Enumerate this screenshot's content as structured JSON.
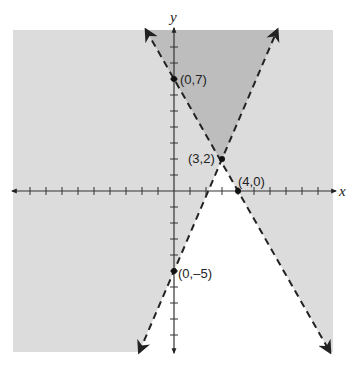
{
  "chart_data": {
    "type": "line",
    "title": "",
    "xlabel": "x",
    "ylabel": "y",
    "xlim": [
      -10,
      10
    ],
    "ylim": [
      -10,
      10
    ],
    "grid": false,
    "ticks": {
      "x": [
        -9,
        -8,
        -7,
        -6,
        -5,
        -4,
        -3,
        -2,
        -1,
        1,
        2,
        3,
        4,
        5,
        6,
        7,
        8,
        9
      ],
      "y": [
        -9,
        -8,
        -7,
        -6,
        -5,
        -4,
        -3,
        -2,
        -1,
        1,
        2,
        3,
        4,
        5,
        6,
        7,
        8,
        9
      ]
    },
    "series": [
      {
        "name": "boundary line 1",
        "style": "dashed",
        "equation": "y = -7/4 x + 7",
        "points": [
          [
            0,
            7
          ],
          [
            4,
            0
          ]
        ]
      },
      {
        "name": "boundary line 2",
        "style": "dashed",
        "equation": "y = 7/3 x - 5",
        "points": [
          [
            0,
            -5
          ],
          [
            3,
            2
          ]
        ]
      }
    ],
    "annotations": [
      {
        "label": "(0,7)",
        "x": 0,
        "y": 7
      },
      {
        "label": "(3,2)",
        "x": 3,
        "y": 2
      },
      {
        "label": "(4,0)",
        "x": 4,
        "y": 0
      },
      {
        "label": "(0,–5)",
        "x": 0,
        "y": -5
      }
    ],
    "shading": {
      "light_region": "union of half-planes (light gray)",
      "dark_region": "overlap of both half-planes above intersection (dark gray)",
      "unshaded_region": "wedge below intersection point (white)"
    },
    "colors": {
      "light": "#dcdcdc",
      "dark": "#bdbdbd",
      "unshaded": "#ffffff",
      "ink": "#222222"
    }
  },
  "labels": {
    "x_axis": "x",
    "y_axis": "y",
    "p1": "(0,7)",
    "p2": "(3,2)",
    "p3": "(4,0)",
    "p4": "(0,–5)"
  }
}
